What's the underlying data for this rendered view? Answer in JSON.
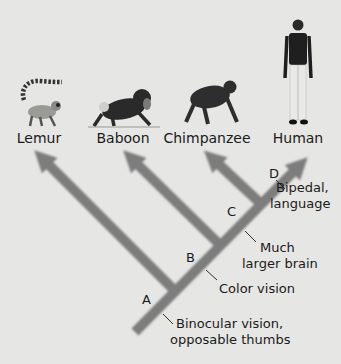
{
  "diagram": {
    "type": "cladogram",
    "taxa": [
      {
        "name": "Lemur",
        "icon": "lemur-icon"
      },
      {
        "name": "Baboon",
        "icon": "baboon-icon"
      },
      {
        "name": "Chimpanzee",
        "icon": "chimpanzee-icon"
      },
      {
        "name": "Human",
        "icon": "human-icon"
      }
    ],
    "nodes": [
      {
        "label": "A",
        "trait": "Binocular vision, opposable thumbs",
        "trait_lines": [
          "Binocular vision,",
          "opposable thumbs"
        ]
      },
      {
        "label": "B",
        "trait": "Color vision",
        "trait_lines": [
          "Color vision"
        ]
      },
      {
        "label": "C",
        "trait": "Much larger brain",
        "trait_lines": [
          "Much",
          "larger brain"
        ]
      },
      {
        "label": "D",
        "trait": "Bipedal, language",
        "trait_lines": [
          "Bipedal,",
          "language"
        ]
      }
    ],
    "colors": {
      "background": "#e6e6e4",
      "branch": "#7d7d7d",
      "text": "#1a1a1a"
    }
  }
}
